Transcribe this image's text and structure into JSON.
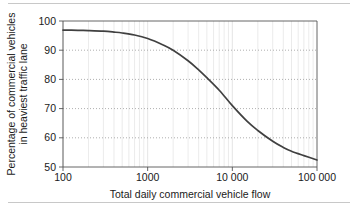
{
  "chart_data": {
    "type": "line",
    "title": "",
    "subtitle": "",
    "xlabel": "Total daily commercial vehicle flow",
    "ylabel_line1": "Percentage of commercial vehicles",
    "ylabel_line2": "in heaviest traffic lane",
    "xscale": "log",
    "yscale": "linear",
    "xlim": [
      100,
      100000
    ],
    "ylim": [
      50,
      100
    ],
    "grid": "horizontal-dotted-major, vertical-log-minor",
    "legend": "none",
    "x_tick_labels": [
      "100",
      "1000",
      "10 000",
      "100 000"
    ],
    "x_tick_values": [
      100,
      1000,
      10000,
      100000
    ],
    "y_tick_labels": [
      "100",
      "90",
      "80",
      "70",
      "60",
      "50"
    ],
    "y_tick_values": [
      100,
      90,
      80,
      70,
      60,
      50
    ],
    "series": [
      {
        "name": "Percentage of commercial vehicles in heaviest traffic lane",
        "color": "#404040",
        "x": [
          100,
          150,
          200,
          300,
          400,
          500,
          700,
          1000,
          1500,
          2000,
          3000,
          4000,
          5000,
          7000,
          10000,
          15000,
          20000,
          30000,
          40000,
          50000,
          70000,
          100000
        ],
        "y": [
          96.9,
          96.8,
          96.7,
          96.5,
          96.2,
          95.9,
          95.2,
          94.0,
          91.9,
          90.0,
          86.4,
          83.3,
          80.6,
          76.3,
          71.0,
          65.6,
          62.5,
          58.8,
          56.7,
          55.4,
          53.9,
          52.4
        ]
      }
    ],
    "annotations": []
  },
  "colors": {
    "curve": "#404040",
    "axis": "#555555",
    "gridline_horizontal": "#9a9a9a",
    "gridline_vertical": "#e2e2e2",
    "text": "#1a1a1a",
    "rule": "#c8c8c8",
    "background": "#ffffff"
  }
}
